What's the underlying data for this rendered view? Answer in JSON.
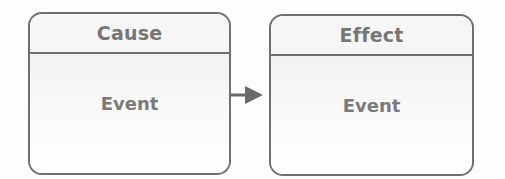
{
  "diagram": {
    "type": "cause-effect",
    "colors": {
      "stroke": "#6f6f6f",
      "text": "#767676",
      "fill": "#f7f7f7",
      "arrow": "#6a6a6a"
    },
    "nodes": [
      {
        "id": "cause",
        "title": "Cause",
        "body": "Event"
      },
      {
        "id": "effect",
        "title": "Effect",
        "body": "Event"
      }
    ],
    "edges": [
      {
        "from": "cause",
        "to": "effect",
        "style": "solid-arrow"
      }
    ]
  }
}
